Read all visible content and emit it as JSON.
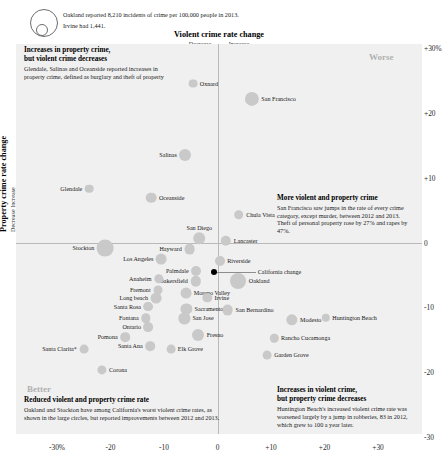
{
  "legend": {
    "line1": "Oakland reported 8,210 incidents of crime per 100,000 people in 2013.",
    "line2": "Irvine had 1,441.",
    "big_circle_name": "oakland-size-circle",
    "small_circle_name": "irvine-size-circle"
  },
  "header": {
    "x_axis_title": "Violent crime rate change",
    "x_axis_sub_decrease": "Decrease",
    "x_axis_sub_increase": "Increase",
    "y_axis_title": "Property crime rate change",
    "y_axis_sub": "Decrease   Increase"
  },
  "corners": {
    "worse": "Worse",
    "better": "Better"
  },
  "notes": {
    "top_left": {
      "head_line1": "Increases in property crime,",
      "head_line2": "but violent crime decreases",
      "body": "Glendale, Salinas and Oceanside reported increases in property crime, defined as burglary and theft of property"
    },
    "right": {
      "head": "More violent and property crime",
      "body": "San Francisco saw jumps in the rate of every crime category, except murder, between 2012 and 2013. Theft of personal property rose by 27% and rapes by 47%."
    },
    "bottom_left": {
      "head": "Reduced violent and property crime rate",
      "body": "Oakland and Stockton have among California's worst violent crime rates, as shown in the large circles, but reported improvements between 2012 and 2013."
    },
    "bottom_right": {
      "head_line1": "Increases in violent crime,",
      "head_line2": "but property crime decreases",
      "body": "Huntington Beach's increased violent crime rate was worsened largely by a jump in robberies, 83 in 2012, which grew to 100 a year later."
    }
  },
  "chart_data": {
    "type": "scatter",
    "xlabel": "Violent crime rate change",
    "ylabel": "Property crime rate change",
    "xlim": [
      -33,
      34
    ],
    "ylim": [
      -33,
      33
    ],
    "xticks": [
      "-30%",
      "-20",
      "-10",
      "0",
      "+10",
      "+20",
      "+30"
    ],
    "xtick_values": [
      -30,
      -20,
      -10,
      0,
      10,
      20,
      30
    ],
    "yticks": [
      "+30%",
      "+20",
      "+10",
      "0",
      "-10",
      "-20",
      "-30"
    ],
    "ytick_values": [
      30,
      20,
      10,
      0,
      -10,
      -20,
      -30
    ],
    "grid": false,
    "legend": "none",
    "size_encoding": "total crime incidents per 100,000 people in 2013",
    "points": [
      {
        "label": "Oxnard",
        "x": -4.6,
        "y": 24.5,
        "r": 4.4,
        "lpos": "right"
      },
      {
        "label": "San Francisco",
        "x": 6.4,
        "y": 22.2,
        "r": 7.1,
        "lpos": "right"
      },
      {
        "label": "Salinas",
        "x": -6.0,
        "y": 13.5,
        "r": 6.0,
        "lpos": "left"
      },
      {
        "label": "Glendale",
        "x": -24.0,
        "y": 8.3,
        "r": 4.3,
        "lpos": "left"
      },
      {
        "label": "Oceanside",
        "x": -12.4,
        "y": 6.9,
        "r": 5.3,
        "lpos": "right"
      },
      {
        "label": "Chula Vista",
        "x": 4.0,
        "y": 4.3,
        "r": 4.8,
        "lpos": "right"
      },
      {
        "label": "San Diego",
        "x": -3.4,
        "y": 0.7,
        "r": 5.8,
        "lpos": "above"
      },
      {
        "label": "Lancaster",
        "x": 1.6,
        "y": 0.3,
        "r": 5.2,
        "lpos": "right"
      },
      {
        "label": "Stockton",
        "x": -21.0,
        "y": -0.9,
        "r": 8.4,
        "lpos": "left"
      },
      {
        "label": "Hayward",
        "x": -5.2,
        "y": -1.0,
        "r": 5.4,
        "lpos": "left"
      },
      {
        "label": "Los Angeles",
        "x": -10.5,
        "y": -2.6,
        "r": 5.4,
        "lpos": "left"
      },
      {
        "label": "Riverside",
        "x": 0.4,
        "y": -2.9,
        "r": 5.0,
        "lpos": "right"
      },
      {
        "label": "Palmdale",
        "x": -4.0,
        "y": -4.4,
        "r": 5.0,
        "lpos": "left"
      },
      {
        "label": "California change",
        "x": -0.7,
        "y": -4.6,
        "r": 3.0,
        "lpos": "connector",
        "dark": true
      },
      {
        "label": "Bakersfield",
        "x": -4.1,
        "y": -6.0,
        "r": 5.2,
        "lpos": "left"
      },
      {
        "label": "Oakland",
        "x": 3.9,
        "y": -6.0,
        "r": 8.0,
        "lpos": "right"
      },
      {
        "label": "Anaheim",
        "x": -11.0,
        "y": -5.6,
        "r": 4.7,
        "lpos": "left"
      },
      {
        "label": "Fremont",
        "x": -11.2,
        "y": -7.3,
        "r": 4.5,
        "lpos": "left"
      },
      {
        "label": "Long beach",
        "x": -11.5,
        "y": -8.6,
        "r": 5.4,
        "lpos": "left"
      },
      {
        "label": "Moreno Valley",
        "x": -5.9,
        "y": -7.8,
        "r": 5.4,
        "lpos": "right"
      },
      {
        "label": "Irvine",
        "x": -1.9,
        "y": -8.5,
        "r": 4.7,
        "lpos": "right"
      },
      {
        "label": "Santa Rosa",
        "x": -12.9,
        "y": -9.9,
        "r": 4.9,
        "lpos": "left"
      },
      {
        "label": "Sacramento",
        "x": -5.8,
        "y": -10.2,
        "r": 5.6,
        "lpos": "right"
      },
      {
        "label": "San Bernardino",
        "x": 1.9,
        "y": -10.4,
        "r": 5.4,
        "lpos": "right"
      },
      {
        "label": "Modesto",
        "x": 13.9,
        "y": -11.9,
        "r": 5.7,
        "lpos": "right"
      },
      {
        "label": "Huntington Beach",
        "x": 20.2,
        "y": -11.6,
        "r": 4.2,
        "lpos": "right"
      },
      {
        "label": "Fontana",
        "x": -13.4,
        "y": -11.7,
        "r": 4.7,
        "lpos": "left"
      },
      {
        "label": "San Jose",
        "x": -6.2,
        "y": -11.7,
        "r": 5.6,
        "lpos": "right"
      },
      {
        "label": "Ontario",
        "x": -12.9,
        "y": -13.1,
        "r": 4.9,
        "lpos": "left"
      },
      {
        "label": "Pomona",
        "x": -17.3,
        "y": -14.6,
        "r": 4.8,
        "lpos": "left"
      },
      {
        "label": "Fresno",
        "x": -3.6,
        "y": -14.3,
        "r": 6.0,
        "lpos": "right"
      },
      {
        "label": "Rancho Cucamonga",
        "x": 10.6,
        "y": -14.8,
        "r": 4.2,
        "lpos": "right"
      },
      {
        "label": "Santa Clarita*",
        "x": -25.0,
        "y": -16.4,
        "r": 4.4,
        "lpos": "left"
      },
      {
        "label": "Santa Ana",
        "x": -12.6,
        "y": -16.0,
        "r": 4.8,
        "lpos": "left"
      },
      {
        "label": "Elk Grove",
        "x": -8.7,
        "y": -16.4,
        "r": 4.4,
        "lpos": "right"
      },
      {
        "label": "Garden Grove",
        "x": 9.3,
        "y": -17.4,
        "r": 4.4,
        "lpos": "right"
      },
      {
        "label": "Corona",
        "x": -21.6,
        "y": -19.7,
        "r": 4.6,
        "lpos": "right"
      }
    ]
  }
}
